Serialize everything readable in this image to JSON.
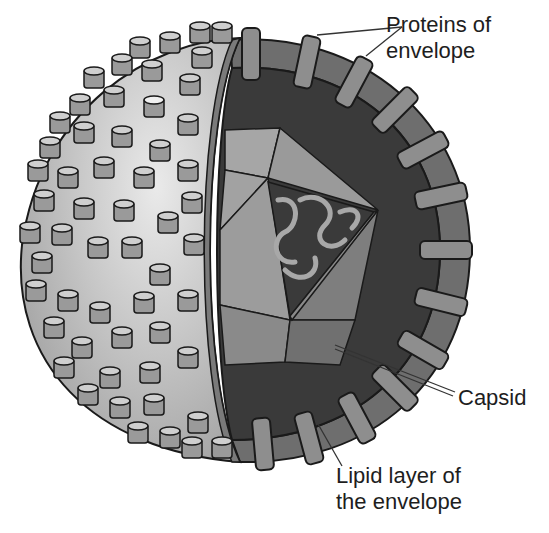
{
  "diagram": {
    "labels": {
      "proteins_of_envelope": {
        "line1": "Proteins of",
        "line2": "envelope"
      },
      "capsid": {
        "line1": "Capsid"
      },
      "lipid_layer": {
        "line1": "Lipid layer of",
        "line2": "the envelope"
      }
    },
    "colors": {
      "background": "#ffffff",
      "sphere_surface": "#c4c4c4",
      "sphere_highlight": "#e6e6e6",
      "knob_fill": "#9a9a9a",
      "knob_top": "#cfcfcf",
      "lipid_layer": "#6e6e6e",
      "envelope_protein": "#8e8e8e",
      "interior_dark": "#3a3a3a",
      "capsid_face_light": "#9c9c9c",
      "capsid_face_mid": "#828282",
      "capsid_face_dark": "#6a6a6a",
      "rna_coil": "#a8a8a8",
      "outline": "#1a1a1a",
      "text": "#1e1e1e"
    }
  }
}
